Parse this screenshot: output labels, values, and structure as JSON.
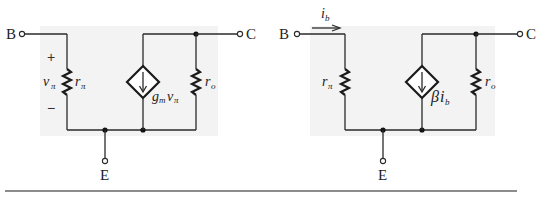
{
  "figure": {
    "left_circuit": {
      "name": "hybrid-pi model (transconductance form)",
      "terminals": {
        "base": "B",
        "collector": "C",
        "emitter": "E"
      },
      "input_resistor": {
        "symbol": "r",
        "subscript": "π"
      },
      "input_voltage": {
        "symbol": "v",
        "subscript": "π",
        "plus": "+",
        "minus": "−"
      },
      "dependent_source": {
        "coef": "g",
        "coef_sub": "m",
        "var": "v",
        "var_sub": "π"
      },
      "output_resistor": {
        "symbol": "r",
        "subscript": "o"
      }
    },
    "right_circuit": {
      "name": "hybrid-pi model (current-gain form)",
      "terminals": {
        "base": "B",
        "collector": "C",
        "emitter": "E"
      },
      "input_current": {
        "symbol": "i",
        "subscript": "b"
      },
      "input_resistor": {
        "symbol": "r",
        "subscript": "π"
      },
      "dependent_source": {
        "coef": "β",
        "var": "i",
        "var_sub": "b"
      },
      "output_resistor": {
        "symbol": "r",
        "subscript": "o"
      }
    },
    "colors": {
      "wire": "#2a2a2a",
      "background_shade": "#f3f3f3",
      "rule": "#666666"
    }
  }
}
